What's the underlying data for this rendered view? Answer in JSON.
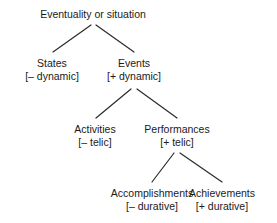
{
  "diagram": {
    "line_color": "#2b2b2b",
    "text_color": "#1a1a1a",
    "background": "#ffffff",
    "nodes": [
      {
        "id": "root",
        "label": "Eventuality or situation",
        "feature": "",
        "cx": 93,
        "cy": 8
      },
      {
        "id": "states",
        "label": "States",
        "feature": "[– dynamic]",
        "cx": 52,
        "cy": 57
      },
      {
        "id": "events",
        "label": "Events",
        "feature": "[+ dynamic]",
        "cx": 134,
        "cy": 57
      },
      {
        "id": "activities",
        "label": "Activities",
        "feature": "[– telic]",
        "cx": 95,
        "cy": 123
      },
      {
        "id": "performances",
        "label": "Performances",
        "feature": "[+ telic]",
        "cx": 177,
        "cy": 123
      },
      {
        "id": "accomplishments",
        "label": "Accomplishments",
        "feature": "[– durative]",
        "cx": 152,
        "cy": 187
      },
      {
        "id": "achievements",
        "label": "Achievements",
        "feature": "[+ durative]",
        "cx": 222,
        "cy": 187
      }
    ],
    "edges": [
      {
        "from": "root",
        "to": "states",
        "x1": 91,
        "y1": 25,
        "x2": 53,
        "y2": 52
      },
      {
        "from": "root",
        "to": "events",
        "x1": 96,
        "y1": 25,
        "x2": 134,
        "y2": 52
      },
      {
        "from": "events",
        "to": "activities",
        "x1": 131,
        "y1": 89,
        "x2": 96,
        "y2": 118
      },
      {
        "from": "events",
        "to": "performances",
        "x1": 137,
        "y1": 89,
        "x2": 177,
        "y2": 118
      },
      {
        "from": "performances",
        "to": "accomplishments",
        "x1": 174,
        "y1": 153,
        "x2": 152,
        "y2": 182
      },
      {
        "from": "performances",
        "to": "achievements",
        "x1": 180,
        "y1": 153,
        "x2": 222,
        "y2": 182
      }
    ]
  }
}
